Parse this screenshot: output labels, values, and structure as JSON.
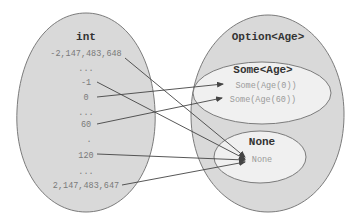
{
  "colors": {
    "outer_fill": "#d9d9d9",
    "inner_fill": "#f0f0f0",
    "stroke": "#6e6e6e",
    "title_text": "#333333",
    "value_text": "#7a7a7a",
    "inner_value_text": "#9a9a9a",
    "arrow": "#444444"
  },
  "left_set": {
    "title": "int",
    "values": {
      "min": "-2,147,483,648",
      "dots1": "...",
      "neg_one": "-1",
      "zero": "0",
      "dots2": "...",
      "sixty": "60",
      "dot3": ".",
      "one_twenty": "120",
      "dots4": "...",
      "max": "2,147,483,647"
    }
  },
  "right_set": {
    "title": "Option<Age>",
    "some": {
      "title": "Some<Age>",
      "values": {
        "age0": "Some(Age(0))",
        "age60": "Some(Age(60))"
      }
    },
    "none": {
      "title": "None",
      "value": "None"
    }
  },
  "mappings": [
    {
      "from": "-2,147,483,648",
      "to": "None"
    },
    {
      "from": "-1",
      "to": "None"
    },
    {
      "from": "0",
      "to": "Some(Age(0))"
    },
    {
      "from": "60",
      "to": "Some(Age(60))"
    },
    {
      "from": "120",
      "to": "None"
    },
    {
      "from": "2,147,483,647",
      "to": "None"
    }
  ]
}
